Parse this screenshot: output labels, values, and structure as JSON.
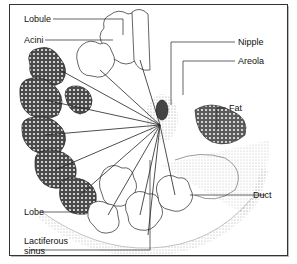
{
  "diagram": {
    "labels": {
      "lobule": "Lobule",
      "acini": "Acini",
      "nipple": "Nipple",
      "areola": "Areola",
      "fat": "Fat",
      "lobe": "Lobe",
      "duct": "Duct",
      "lactiferous_sinus_line1": "Lactiferous",
      "lactiferous_sinus_line2": "sinus"
    },
    "colors": {
      "ink": "#222222",
      "lobe_fill": "#555555",
      "background": "#ffffff"
    }
  }
}
